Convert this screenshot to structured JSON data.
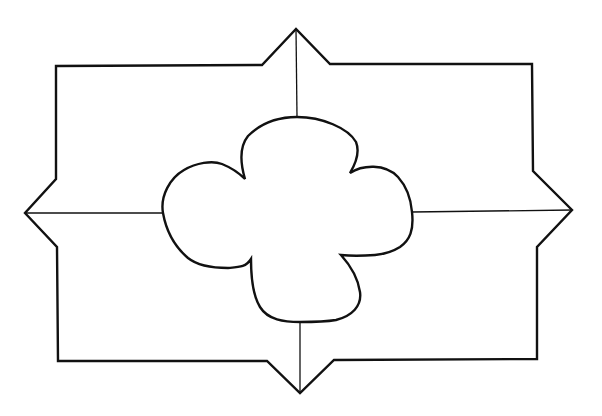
{
  "figure": {
    "stroke_color": "#111111",
    "background_color": "#ffffff",
    "components": [
      {
        "name": "outer-frame",
        "shape": "rectangle with four pointed projections"
      },
      {
        "name": "vertical-divider",
        "shape": "line"
      },
      {
        "name": "horizontal-divider",
        "shape": "line"
      },
      {
        "name": "center-quatrefoil",
        "shape": "four-lobed foil"
      }
    ]
  }
}
